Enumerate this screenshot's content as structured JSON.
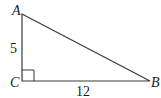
{
  "diagram": {
    "type": "right-triangle",
    "vertices": {
      "A": {
        "label": "A",
        "x": 22,
        "y": 14
      },
      "B": {
        "label": "B",
        "x": 150,
        "y": 81
      },
      "C": {
        "label": "C",
        "x": 22,
        "y": 81
      }
    },
    "right_angle_at": "C",
    "sides": {
      "AC": {
        "label": "5"
      },
      "CB": {
        "label": "12"
      }
    },
    "colors": {
      "stroke": "#3a3a3a",
      "text": "#1a1a1a",
      "background": "#ffffff"
    }
  }
}
